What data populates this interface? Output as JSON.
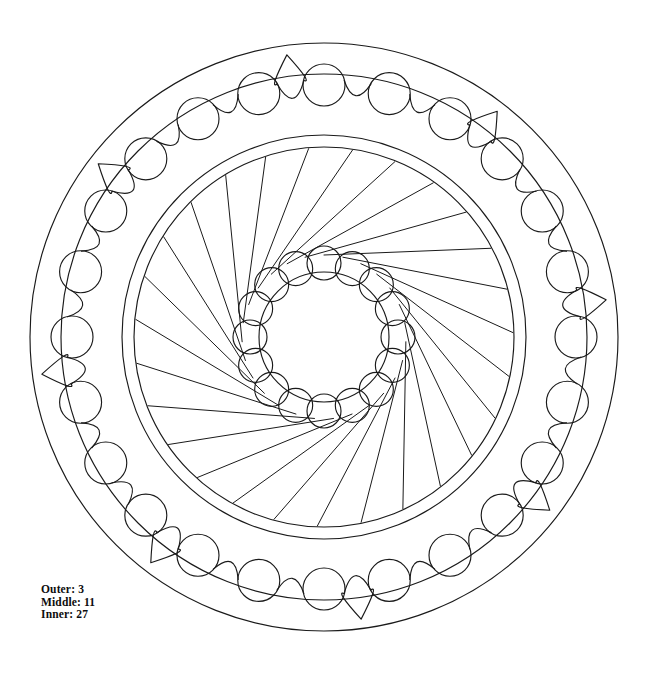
{
  "page": {
    "background_color": "#ffffff",
    "stroke_color": "#1a1a1a",
    "width": 646,
    "height": 674
  },
  "legend": {
    "outer_line": "Outer: 3",
    "middle_line": "Middle: 11",
    "inner_line": "Inner: 27",
    "outer_label": "Outer",
    "middle_label": "Middle",
    "inner_label": "Inner",
    "outer_value": "3",
    "middle_value": "11",
    "inner_value": "27"
  },
  "chart_data": {
    "type": "diagram",
    "center": {
      "x": 324,
      "y": 337
    },
    "rings": [
      {
        "name": "outer-ring",
        "label": "Outer",
        "value": 3,
        "description": "Outer band: ring of circles joined by scalloped arcs, with a sharp cusp every 3rd junction",
        "boundary_outer_radius": 294,
        "boundary_inner_radius": 263,
        "circle_count": 24,
        "circle_radius": 21,
        "circle_orbit_radius": 252,
        "cusp_period": 3,
        "scallop_bulge": 16
      },
      {
        "name": "middle-ring",
        "label": "Middle",
        "value": 11,
        "description": "Double concentric boundary circles enclosing the spiral ray field",
        "boundary_outer_radius": 202,
        "boundary_inner_radius": 190,
        "ring_gap": 12
      },
      {
        "name": "inner-ring",
        "label": "Inner",
        "value": 27,
        "description": "Spiral rays sweeping from the inner core out to the middle ring",
        "ray_count": 27,
        "ray_inner_radius": 82,
        "ray_outer_radius": 189,
        "spiral_twist_degrees": 62
      },
      {
        "name": "inner-core",
        "label": "Core",
        "description": "Central circle framed by a ring of petal circles",
        "core_radius": 65,
        "petal_count": 16,
        "petal_radius": 17,
        "petal_orbit_radius": 74
      }
    ],
    "annotations": [
      "Outer: 3",
      "Middle: 11",
      "Inner: 27"
    ]
  }
}
